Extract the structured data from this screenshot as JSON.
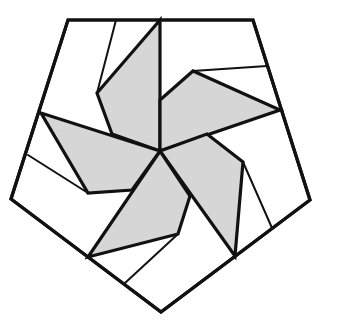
{
  "figure": {
    "fill_color": "#d6d6d6",
    "stroke_color": "#111111",
    "background": "#ffffff",
    "center": [
      160,
      151
    ],
    "pentagon_vertices": [
      [
        68,
        20
      ],
      [
        253,
        20
      ],
      [
        310,
        200
      ],
      [
        161,
        312
      ],
      [
        11,
        199
      ]
    ],
    "blades": [
      {
        "name": "top",
        "points": [
          [
            160,
            151
          ],
          [
            112,
            134
          ],
          [
            97,
            93
          ],
          [
            160,
            20
          ]
        ]
      },
      {
        "name": "upper-right",
        "points": [
          [
            160,
            151
          ],
          [
            160,
            100
          ],
          [
            193,
            71
          ],
          [
            280,
            110
          ]
        ]
      },
      {
        "name": "lower-right",
        "points": [
          [
            160,
            151
          ],
          [
            207,
            134
          ],
          [
            243,
            162
          ],
          [
            235,
            256
          ]
        ]
      },
      {
        "name": "bottom",
        "points": [
          [
            160,
            151
          ],
          [
            190,
            196
          ],
          [
            178,
            234
          ],
          [
            88,
            257
          ]
        ]
      },
      {
        "name": "left",
        "points": [
          [
            160,
            151
          ],
          [
            132,
            190
          ],
          [
            88,
            193
          ],
          [
            41,
            113
          ]
        ]
      }
    ],
    "thin_lines": [
      [
        [
          116,
          20
        ],
        [
          97,
          93
        ]
      ],
      [
        [
          193,
          71
        ],
        [
          267,
          66
        ]
      ],
      [
        [
          243,
          162
        ],
        [
          272,
          228
        ]
      ],
      [
        [
          178,
          234
        ],
        [
          125,
          283
        ]
      ],
      [
        [
          88,
          193
        ],
        [
          28,
          155
        ]
      ]
    ]
  }
}
